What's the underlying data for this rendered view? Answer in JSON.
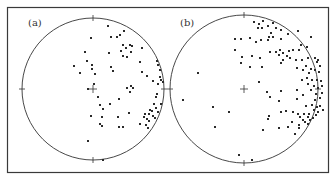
{
  "chart_data": [
    {
      "type": "scatter",
      "title": "(a)",
      "projection": "equal-area stereonet (circle)",
      "frame": {
        "x": 7,
        "y": 7,
        "w": 321,
        "h": 165
      },
      "circle": {
        "cx": 93,
        "cy": 89,
        "r": 71
      },
      "label_pos": {
        "x": 28,
        "y": 26
      },
      "points": [
        [
          108,
          26
        ],
        [
          91,
          38
        ],
        [
          111,
          37
        ],
        [
          117,
          37
        ],
        [
          120,
          35
        ],
        [
          124,
          31
        ],
        [
          85,
          52
        ],
        [
          109,
          53
        ],
        [
          121,
          51
        ],
        [
          123,
          45
        ],
        [
          126,
          48
        ],
        [
          130,
          45
        ],
        [
          123,
          56
        ],
        [
          127,
          57
        ],
        [
          131,
          52
        ],
        [
          132,
          46
        ],
        [
          87,
          61
        ],
        [
          74,
          66
        ],
        [
          92,
          65
        ],
        [
          92,
          69
        ],
        [
          80,
          73
        ],
        [
          95,
          74
        ],
        [
          111,
          67
        ],
        [
          113,
          71
        ],
        [
          140,
          62
        ],
        [
          142,
          48
        ],
        [
          157,
          61
        ],
        [
          158,
          65
        ],
        [
          160,
          70
        ],
        [
          142,
          72
        ],
        [
          147,
          76
        ],
        [
          160,
          77
        ],
        [
          153,
          81
        ],
        [
          161,
          80
        ],
        [
          158,
          84
        ],
        [
          163,
          82
        ],
        [
          94,
          84
        ],
        [
          88,
          89
        ],
        [
          127,
          88
        ],
        [
          131,
          86
        ],
        [
          133,
          88
        ],
        [
          130,
          92
        ],
        [
          98,
          97
        ],
        [
          119,
          99
        ],
        [
          156,
          97
        ],
        [
          157,
          94
        ],
        [
          100,
          105
        ],
        [
          110,
          104
        ],
        [
          103,
          109
        ],
        [
          161,
          104
        ],
        [
          154,
          104
        ],
        [
          156,
          108
        ],
        [
          150,
          110
        ],
        [
          158,
          112
        ],
        [
          149,
          114
        ],
        [
          152,
          111
        ],
        [
          145,
          114
        ],
        [
          91,
          116
        ],
        [
          102,
          117
        ],
        [
          118,
          117
        ],
        [
          129,
          113
        ],
        [
          144,
          117
        ],
        [
          147,
          119
        ],
        [
          149,
          121
        ],
        [
          153,
          116
        ],
        [
          155,
          118
        ],
        [
          100,
          124
        ],
        [
          102,
          126
        ],
        [
          119,
          127
        ],
        [
          123,
          127
        ],
        [
          140,
          124
        ],
        [
          146,
          125
        ],
        [
          148,
          128
        ],
        [
          88,
          141
        ],
        [
          103,
          160
        ]
      ]
    },
    {
      "type": "scatter",
      "title": "(b)",
      "projection": "equal-area stereonet (circle)",
      "circle": {
        "cx": 244,
        "cy": 89,
        "r": 74
      },
      "label_pos": {
        "x": 180,
        "y": 26
      },
      "points": [
        [
          254,
          22
        ],
        [
          259,
          24
        ],
        [
          263,
          21
        ],
        [
          273,
          23
        ],
        [
          258,
          28
        ],
        [
          262,
          28
        ],
        [
          268,
          26
        ],
        [
          276,
          28
        ],
        [
          281,
          30
        ],
        [
          288,
          34
        ],
        [
          271,
          33
        ],
        [
          269,
          37
        ],
        [
          273,
          37
        ],
        [
          281,
          39
        ],
        [
          298,
          31
        ],
        [
          311,
          37
        ],
        [
          235,
          39
        ],
        [
          241,
          39
        ],
        [
          250,
          38
        ],
        [
          256,
          42
        ],
        [
          261,
          40
        ],
        [
          268,
          40
        ],
        [
          235,
          50
        ],
        [
          270,
          52
        ],
        [
          276,
          52
        ],
        [
          280,
          50
        ],
        [
          289,
          51
        ],
        [
          293,
          50
        ],
        [
          299,
          50
        ],
        [
          301,
          45
        ],
        [
          307,
          47
        ],
        [
          315,
          58
        ],
        [
          317,
          62
        ],
        [
          318,
          60
        ],
        [
          320,
          66
        ],
        [
          242,
          57
        ],
        [
          252,
          56
        ],
        [
          260,
          58
        ],
        [
          279,
          55
        ],
        [
          283,
          53
        ],
        [
          287,
          56
        ],
        [
          283,
          60
        ],
        [
          290,
          58
        ],
        [
          296,
          60
        ],
        [
          302,
          60
        ],
        [
          308,
          58
        ],
        [
          306,
          66
        ],
        [
          311,
          69
        ],
        [
          315,
          70
        ],
        [
          319,
          72
        ],
        [
          241,
          63
        ],
        [
          250,
          67
        ],
        [
          262,
          67
        ],
        [
          281,
          63
        ],
        [
          297,
          68
        ],
        [
          303,
          70
        ],
        [
          309,
          73
        ],
        [
          307,
          78
        ],
        [
          302,
          80
        ],
        [
          312,
          80
        ],
        [
          317,
          80
        ],
        [
          321,
          81
        ],
        [
          308,
          84
        ],
        [
          314,
          86
        ],
        [
          318,
          88
        ],
        [
          322,
          86
        ],
        [
          259,
          82
        ],
        [
          267,
          92
        ],
        [
          281,
          91
        ],
        [
          297,
          90
        ],
        [
          311,
          90
        ],
        [
          316,
          94
        ],
        [
          322,
          93
        ],
        [
          320,
          98
        ],
        [
          315,
          100
        ],
        [
          303,
          95
        ],
        [
          270,
          97
        ],
        [
          279,
          101
        ],
        [
          297,
          99
        ],
        [
          306,
          106
        ],
        [
          312,
          105
        ],
        [
          317,
          107
        ],
        [
          320,
          106
        ],
        [
          314,
          110
        ],
        [
          318,
          112
        ],
        [
          323,
          110
        ],
        [
          309,
          114
        ],
        [
          281,
          112
        ],
        [
          286,
          111
        ],
        [
          293,
          112
        ],
        [
          298,
          114
        ],
        [
          304,
          114
        ],
        [
          308,
          117
        ],
        [
          310,
          120
        ],
        [
          313,
          118
        ],
        [
          316,
          115
        ],
        [
          269,
          116
        ],
        [
          268,
          119
        ],
        [
          300,
          117
        ],
        [
          303,
          120
        ],
        [
          299,
          125
        ],
        [
          305,
          122
        ],
        [
          308,
          124
        ],
        [
          292,
          122
        ],
        [
          299,
          128
        ],
        [
          288,
          127
        ],
        [
          279,
          128
        ],
        [
          263,
          130
        ],
        [
          295,
          134
        ],
        [
          198,
          73
        ],
        [
          183,
          100
        ],
        [
          213,
          107
        ],
        [
          229,
          112
        ],
        [
          215,
          127
        ],
        [
          239,
          155
        ],
        [
          252,
          160
        ]
      ]
    }
  ],
  "labels": {
    "a": "(a)",
    "b": "(b)"
  },
  "colors": {
    "ink": "#2a2a2a",
    "frame": "#3a3a3a",
    "background": "#ffffff"
  }
}
